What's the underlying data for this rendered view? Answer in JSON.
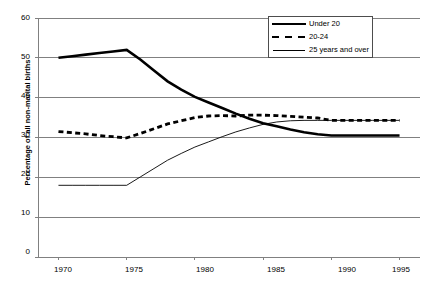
{
  "chart_data": {
    "type": "line",
    "title": "",
    "xlabel": "",
    "ylabel": "Percentage of all non-marital births",
    "xlim": [
      1968.5,
      1996.5
    ],
    "ylim": [
      0,
      60
    ],
    "yticks": [
      0,
      10,
      20,
      30,
      40,
      50,
      60
    ],
    "xticks": [
      1970,
      1975,
      1980,
      1985,
      1990,
      1995
    ],
    "grid": "horizontal",
    "legend_position": "top-right",
    "x": [
      1970,
      1971,
      1972,
      1973,
      1974,
      1975,
      1976,
      1977,
      1978,
      1979,
      1980,
      1981,
      1982,
      1983,
      1984,
      1985,
      1986,
      1987,
      1988,
      1989,
      1990,
      1991,
      1992,
      1993,
      1994,
      1995
    ],
    "series": [
      {
        "name": "Under 20",
        "style": "thick-solid",
        "color": "#000000",
        "values": [
          50.0,
          50.4,
          50.8,
          51.2,
          51.6,
          52.0,
          49.6,
          46.8,
          44.1,
          42.0,
          40.2,
          38.8,
          37.4,
          36.0,
          34.7,
          33.6,
          32.8,
          32.0,
          31.3,
          30.8,
          30.5,
          30.5,
          30.5,
          30.5,
          30.5,
          30.5
        ]
      },
      {
        "name": "20-24",
        "style": "thick-dashed",
        "color": "#000000",
        "values": [
          31.5,
          31.2,
          30.9,
          30.5,
          30.2,
          29.9,
          31.0,
          32.2,
          33.4,
          34.2,
          35.0,
          35.4,
          35.5,
          35.4,
          35.6,
          35.6,
          35.5,
          35.3,
          35.1,
          34.9,
          34.3,
          34.3,
          34.3,
          34.3,
          34.3,
          34.3
        ]
      },
      {
        "name": "25 years and over",
        "style": "thin-solid",
        "color": "#000000",
        "values": [
          18.0,
          18.0,
          18.0,
          18.0,
          18.0,
          18.0,
          20.1,
          22.2,
          24.3,
          26.0,
          27.6,
          28.9,
          30.2,
          31.4,
          32.4,
          33.3,
          33.9,
          34.2,
          34.3,
          34.3,
          34.3,
          34.3,
          34.3,
          34.3,
          34.3,
          34.3
        ]
      }
    ]
  },
  "legend": {
    "items": [
      {
        "label": "Under 20",
        "swatch": "thick-solid"
      },
      {
        "label": "20-24",
        "swatch": "thick-dashed"
      },
      {
        "label": "25 years and over",
        "swatch": "thin-solid"
      }
    ]
  },
  "axis": {
    "y_title": "Percentage of all non-marital births",
    "y_tick_labels": [
      "60",
      "50",
      "40",
      "30",
      "20",
      "10",
      "0"
    ],
    "x_tick_labels": [
      "1970",
      "1975",
      "1980",
      "1985",
      "1990",
      "1995"
    ]
  }
}
